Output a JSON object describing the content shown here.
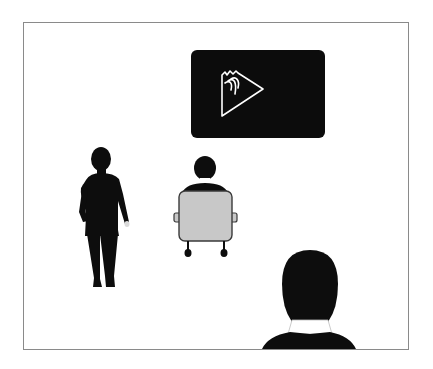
{
  "scene": {
    "description": "Illustration of a room with a presentation screen, a standing person, a seated person in a chair, and a foreground person viewed from behind",
    "colors": {
      "frame_border": "#8a8a8a",
      "screen_bg": "#0c0c0c",
      "screen_icon": "#ffffff",
      "silhouette": "#0d0d0d",
      "chair_fill": "#c8c8c8",
      "chair_outline": "#3a3a3a",
      "collar": "#ffffff"
    },
    "screen": {
      "icon": "volcano-play-icon"
    },
    "figures": [
      {
        "name": "standing-person",
        "pose": "walking"
      },
      {
        "name": "seated-person",
        "pose": "seated-back-view"
      },
      {
        "name": "foreground-person",
        "pose": "head-and-shoulders-back-view"
      }
    ]
  }
}
